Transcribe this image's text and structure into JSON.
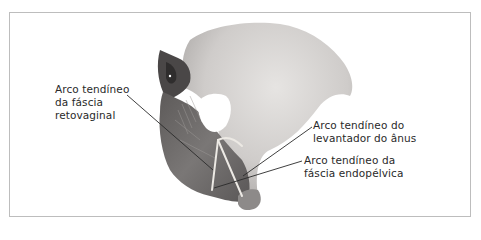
{
  "figure": {
    "colors": {
      "frame_border": "#bdbdbd",
      "bone_light": "#d7d5d3",
      "bone_mid": "#a9a6a4",
      "muscle_dark": "#6e6b6a",
      "shadow_dark": "#3c3a3a",
      "tendon": "#e9e7e2",
      "leader_line": "#2a2a2a",
      "label_text": "#2a2a2a"
    },
    "labels": [
      {
        "id": "arco-tendineo-fascia-retovaginal",
        "lines": [
          "Arco tendíneo",
          "da fáscia",
          "retovaginal"
        ]
      },
      {
        "id": "arco-tendineo-levantador-anus",
        "lines": [
          "Arco tendíneo do",
          "levantador do ânus"
        ]
      },
      {
        "id": "arco-tendineo-fascia-endopelvica",
        "lines": [
          "Arco tendíneo da",
          "fáscia endopélvica"
        ]
      }
    ]
  }
}
